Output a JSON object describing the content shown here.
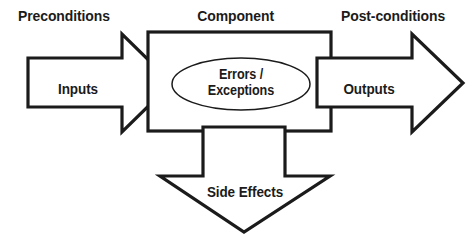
{
  "diagram": {
    "background_color": "#ffffff",
    "stroke_color": "#1b1b1b",
    "labels": {
      "preconditions": "Preconditions",
      "component": "Component",
      "post_conditions": "Post-conditions",
      "inputs": "Inputs",
      "outputs": "Outputs",
      "errors_line1": "Errors /",
      "errors_line2": "Exceptions",
      "side_effects": "Side Effects"
    },
    "nodes": [
      {
        "id": "component-box",
        "type": "rectangle",
        "label": "Component"
      },
      {
        "id": "input-arrow",
        "type": "arrow-right",
        "label": "Inputs"
      },
      {
        "id": "output-arrow",
        "type": "arrow-right",
        "label": "Outputs"
      },
      {
        "id": "side-effects-arrow",
        "type": "arrow-down",
        "label": "Side Effects"
      },
      {
        "id": "errors-ellipse",
        "type": "ellipse",
        "label": "Errors / Exceptions"
      }
    ]
  }
}
